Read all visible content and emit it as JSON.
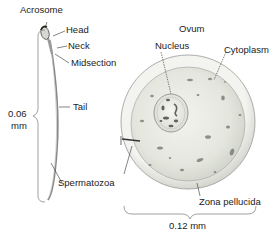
{
  "figure": {
    "sperm": {
      "labels": {
        "acrosome": "Acrosome",
        "head": "Head",
        "neck": "Neck",
        "midsection": "Midsection",
        "tail": "Tail",
        "spermatozoa": "Spermatozoa"
      },
      "scale": {
        "value": "0.06",
        "unit": "mm"
      }
    },
    "ovum": {
      "title": "Ovum",
      "labels": {
        "nucleus": "Nucleus",
        "cytoplasm": "Cytoplasm",
        "zona_pellucida": "Zona pellucida"
      },
      "scale": "0.12 mm"
    }
  }
}
